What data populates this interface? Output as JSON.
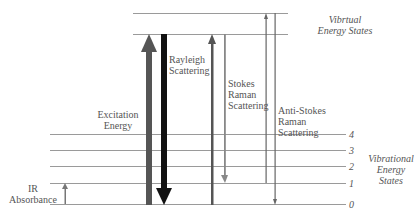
{
  "virtual_states": {
    "label_line1": "Vibrtual",
    "label_line2": "Energy States"
  },
  "vibrational_states": {
    "label_line1": "Vibrational",
    "label_line2": "Energy",
    "label_line3": "States",
    "levels": [
      "4",
      "3",
      "2",
      "1",
      "0"
    ]
  },
  "labels": {
    "excitation_line1": "Excitation",
    "excitation_line2": "Energy",
    "rayleigh_line1": "Rayleigh",
    "rayleigh_line2": "Scattering",
    "stokes_line1": "Stokes",
    "stokes_line2": "Raman",
    "stokes_line3": "Scattering",
    "antistokes_line1": "Anti-Stokes",
    "antistokes_line2": "Raman",
    "antistokes_line3": "Scattering",
    "ir_line1": "IR",
    "ir_line2": "Absorbance"
  },
  "colors": {
    "level_line": "#9a9a9a",
    "excitation_arrow": "#555555",
    "rayleigh_arrow": "#111111",
    "stokes_up": "#555555",
    "stokes_down": "#888888",
    "antistokes": "#666666",
    "ir_arrow": "#777777"
  }
}
